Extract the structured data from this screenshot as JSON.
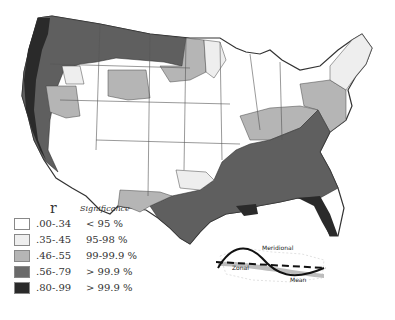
{
  "legend": {
    "r_label": "r",
    "significance_label": "Significance",
    "rows": [
      {
        "range": ".00-.34",
        "significance": "< 95 %",
        "color": "#ffffff"
      },
      {
        "range": ".35-.45",
        "significance": "95-98 %",
        "color": "#eeeeee"
      },
      {
        "range": ".46-.55",
        "significance": "99-99.9 %",
        "color": "#b5b5b5"
      },
      {
        "range": ".56-.79",
        "significance": "> 99.9 %",
        "color": "#6a6a6a"
      },
      {
        "range": ".80-.99",
        "significance": "> 99.9 %",
        "color": "#2a2a2a"
      }
    ]
  },
  "inset": {
    "labels": {
      "meridional": "Meridional",
      "zonal": "Zonal",
      "mean": "Mean"
    }
  },
  "colors": {
    "white": "#ffffff",
    "light": "#eeeeee",
    "medium": "#b5b5b5",
    "dark": "#6a6a6a",
    "black": "#2a2a2a",
    "border": "#333333"
  }
}
